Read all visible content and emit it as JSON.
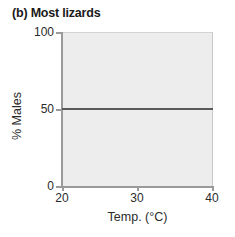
{
  "chart_data": {
    "type": "line",
    "title": "(b) Most lizards",
    "xlabel": "Temp. (°C)",
    "ylabel": "% Males",
    "xlim": [
      20,
      40
    ],
    "ylim": [
      0,
      100
    ],
    "xticks": [
      20,
      30,
      40
    ],
    "yticks": [
      0,
      50,
      100
    ],
    "xtick_labels": [
      "20",
      "30",
      "40"
    ],
    "ytick_labels": [
      "0",
      "50",
      "100"
    ],
    "grid": false,
    "legend": null,
    "plot_background_color": "#ededed",
    "series": [
      {
        "name": "% Males vs Temp.",
        "color": "#595959",
        "x": [
          20,
          25,
          30,
          35,
          40
        ],
        "values": [
          50,
          50,
          50,
          50,
          50
        ]
      }
    ]
  }
}
